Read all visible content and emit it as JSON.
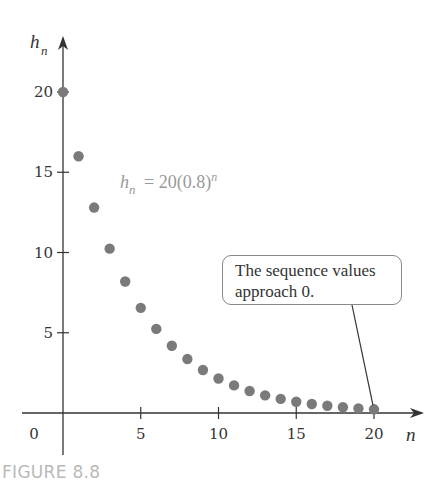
{
  "chart_data": {
    "type": "scatter",
    "title": "",
    "formula": {
      "lhs": "h",
      "lhs_sub": "n",
      "rhs": "= 20(0.8)",
      "rhs_sup": "n"
    },
    "xlabel": "n",
    "ylabel": "h",
    "ylabel_sub": "n",
    "xlim": [
      0,
      21.5
    ],
    "ylim": [
      -2,
      21.5
    ],
    "x_ticks": [
      5,
      10,
      15,
      20
    ],
    "y_ticks": [
      5,
      10,
      15,
      20
    ],
    "origin_label": "0",
    "grid": false,
    "legend": null,
    "x": [
      0,
      1,
      2,
      3,
      4,
      5,
      6,
      7,
      8,
      9,
      10,
      11,
      12,
      13,
      14,
      15,
      16,
      17,
      18,
      19,
      20
    ],
    "series": [
      {
        "name": "h_n = 20(0.8)^n",
        "values": [
          20.0,
          16.0,
          12.8,
          10.24,
          8.19,
          6.55,
          5.24,
          4.19,
          3.36,
          2.68,
          2.15,
          1.72,
          1.37,
          1.1,
          0.88,
          0.7,
          0.56,
          0.45,
          0.36,
          0.29,
          0.23
        ]
      }
    ],
    "annotations": [
      {
        "text": "The sequence values approach 0.",
        "points_to": {
          "x": 20,
          "y": 0.23
        }
      }
    ]
  },
  "callout": {
    "line1": "The sequence values",
    "line2": "approach 0."
  },
  "figure_label": "FIGURE 8.8",
  "colors": {
    "axis": "#333333",
    "points": "#7a7a7a",
    "formula": "#999999",
    "figure_label": "#b9b9b9"
  }
}
